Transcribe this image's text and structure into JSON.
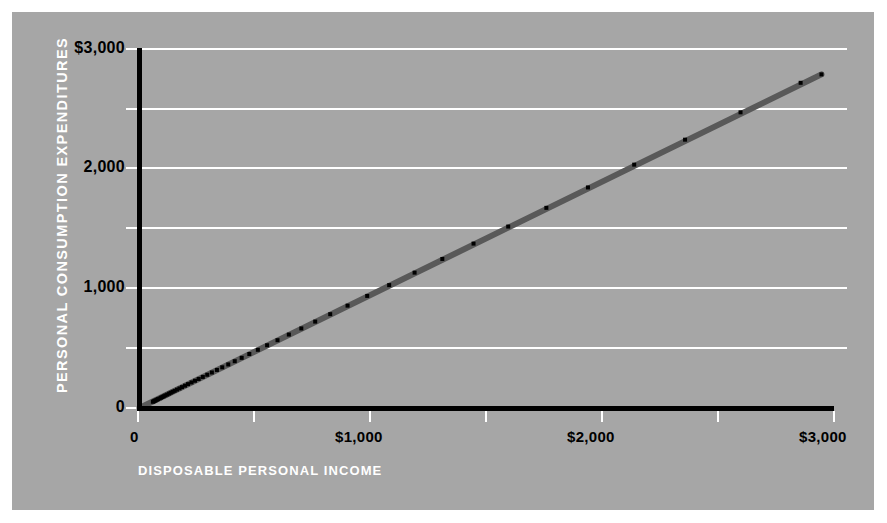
{
  "figure": {
    "background": "#ffffff",
    "panel_color": "#a6a6a6",
    "gridline_color": "#ffffff",
    "axis_color": "#000000",
    "trendline_color": "#595959",
    "marker_color": "#000000",
    "label_color": "#ffffff",
    "tick_label_color": "#000000"
  },
  "axes": {
    "ylabel": "PERSONAL CONSUMPTION  EXPENDITURES",
    "xlabel": "DISPOSABLE PERSONAL INCOME",
    "y_tick_labels": [
      "$3,000",
      "2,000",
      "1,000",
      "0"
    ],
    "x_tick_labels": [
      "0",
      "$1,000",
      "$2,000",
      "$3,000"
    ]
  },
  "chart_data": {
    "type": "scatter",
    "title": "",
    "subtitle": "",
    "xlabel": "DISPOSABLE PERSONAL INCOME",
    "ylabel": "PERSONAL CONSUMPTION  EXPENDITURES",
    "xlim": [
      0,
      3000
    ],
    "ylim": [
      0,
      3000
    ],
    "xticks": [
      0,
      1000,
      2000,
      3000
    ],
    "xtick_labels": [
      "0",
      "$1,000",
      "$2,000",
      "$3,000"
    ],
    "yticks": [
      0,
      1000,
      2000,
      3000
    ],
    "ytick_labels": [
      "0",
      "1,000",
      "2,000",
      "$3,000"
    ],
    "minor_gridlines_y": [
      500,
      1500,
      2500
    ],
    "minor_ticks_x": [
      500,
      1500,
      2500
    ],
    "grid": true,
    "grid_axis": "y",
    "legend": false,
    "legend_position": "none",
    "marker": "square",
    "marker_size": 4,
    "series": [
      {
        "name": "Consumption vs Income",
        "x": [
          58,
          62,
          66,
          70,
          75,
          80,
          87,
          93,
          99,
          105,
          112,
          120,
          128,
          135,
          143,
          152,
          162,
          173,
          184,
          197,
          210,
          225,
          240,
          256,
          274,
          293,
          313,
          335,
          358,
          384,
          412,
          442,
          475,
          512,
          552,
          597,
          646,
          700,
          760,
          825,
          900,
          985,
          1080,
          1190,
          1310,
          1445,
          1595,
          1760,
          1940,
          2140,
          2360,
          2600,
          2860,
          2950
        ],
        "y": [
          52,
          56,
          60,
          64,
          69,
          74,
          80,
          86,
          92,
          98,
          105,
          112,
          120,
          127,
          135,
          143,
          153,
          163,
          174,
          186,
          199,
          213,
          227,
          242,
          259,
          277,
          296,
          317,
          339,
          363,
          390,
          418,
          450,
          485,
          523,
          565,
          612,
          663,
          720,
          782,
          853,
          934,
          1024,
          1128,
          1242,
          1370,
          1512,
          1668,
          1838,
          2028,
          2236,
          2464,
          2710,
          2780
        ]
      }
    ],
    "trendline": {
      "type": "linear_fit",
      "x_start": 0,
      "y_start": 0,
      "x_end": 2950,
      "y_end": 2780,
      "slope": 0.942,
      "intercept": 0
    }
  }
}
